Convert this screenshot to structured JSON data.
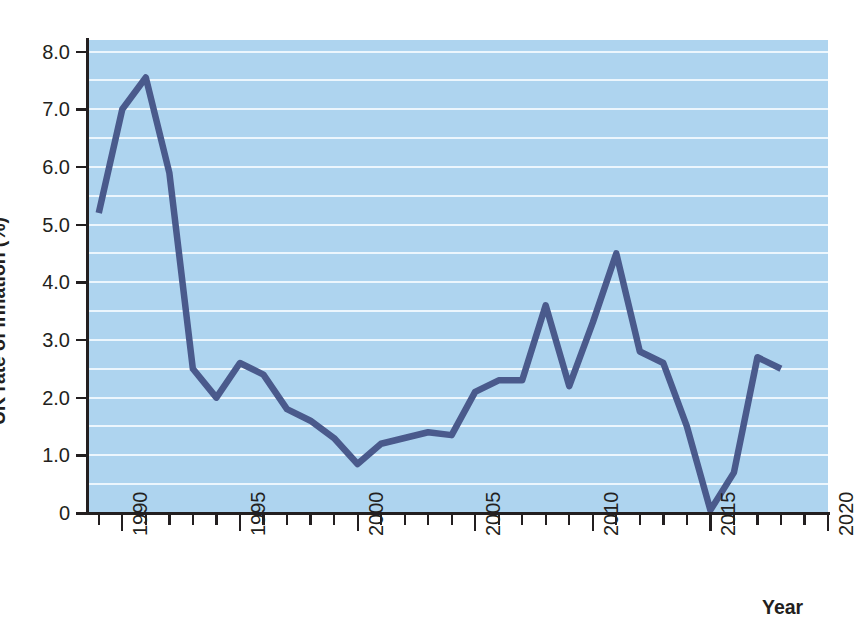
{
  "chart_data": {
    "type": "line",
    "title": "",
    "xlabel": "Year",
    "ylabel": "UK rate of inflation (%)",
    "xlim": [
      1988.5,
      2020.0
    ],
    "ylim": [
      0,
      8.2
    ],
    "grid": true,
    "grid_step": 0.5,
    "legend": "none",
    "series_name": "UK rate of inflation",
    "line_color": "#4a5a8c",
    "plot_background": "#aed4ef",
    "gridline_color": "#ecf6fd",
    "x": [
      1989,
      1990,
      1991,
      1992,
      1993,
      1994,
      1995,
      1996,
      1997,
      1998,
      1999,
      2000,
      2001,
      2002,
      2003,
      2004,
      2005,
      2006,
      2007,
      2008,
      2009,
      2010,
      2011,
      2012,
      2013,
      2014,
      2015,
      2016,
      2017,
      2018
    ],
    "values": [
      5.2,
      7.0,
      7.55,
      5.9,
      2.5,
      2.0,
      2.6,
      2.4,
      1.8,
      1.6,
      1.3,
      0.85,
      1.2,
      1.3,
      1.4,
      1.35,
      2.1,
      2.3,
      2.3,
      3.6,
      2.2,
      3.3,
      4.5,
      2.8,
      2.6,
      1.5,
      0.05,
      0.7,
      2.7,
      2.5
    ],
    "ytick_labels": [
      "8.0",
      "7.0",
      "6.0",
      "5.0",
      "4.0",
      "3.0",
      "2.0",
      "1.0",
      "0"
    ],
    "ytick_values": [
      8.0,
      7.0,
      6.0,
      5.0,
      4.0,
      3.0,
      2.0,
      1.0,
      0
    ],
    "xtick_major_labels": [
      "1990",
      "1995",
      "2000",
      "2005",
      "2010",
      "2015",
      "2020"
    ],
    "xtick_major_values": [
      1990,
      1995,
      2000,
      2005,
      2010,
      2015,
      2020
    ],
    "xtick_minor_values": [
      1989,
      1991,
      1992,
      1993,
      1994,
      1996,
      1997,
      1998,
      1999,
      2001,
      2002,
      2003,
      2004,
      2006,
      2007,
      2008,
      2009,
      2011,
      2012,
      2013,
      2014,
      2016,
      2017,
      2018,
      2019
    ]
  }
}
